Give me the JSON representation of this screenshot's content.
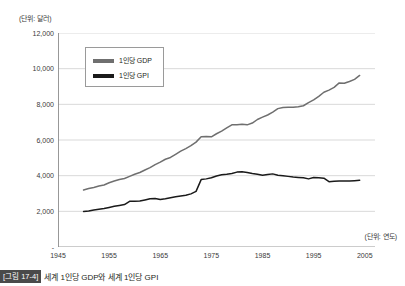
{
  "figure": {
    "unit_y_label": "(단위: 달러)",
    "unit_x_label": "(단위: 연도)",
    "caption_badge": "[그림 17-4]",
    "caption_text": "세계 1인당 GDP와 세계 1인당 GPI"
  },
  "legend": {
    "items": [
      {
        "label": "1인당 GDP",
        "color": "#6f6f6f"
      },
      {
        "label": "1인당 GPI",
        "color": "#1a1a1a"
      }
    ]
  },
  "chart_data": {
    "type": "line",
    "title": "세계 1인당 GDP와 세계 1인당 GPI",
    "xlabel": "(단위: 연도)",
    "ylabel": "(단위: 달러)",
    "xlim": [
      1945,
      2007
    ],
    "ylim": [
      0,
      12000
    ],
    "grid": true,
    "legend_position": "top-left-inside",
    "ytick_labels": [
      "12,000",
      "10,000",
      "8,000",
      "6,000",
      "4,000",
      "2,000",
      "-"
    ],
    "ytick_values": [
      12000,
      10000,
      8000,
      6000,
      4000,
      2000,
      0
    ],
    "xtick_labels": [
      "1945",
      "1955",
      "1965",
      "1975",
      "1985",
      "1995",
      "2005"
    ],
    "xtick_values": [
      1945,
      1955,
      1965,
      1975,
      1985,
      1995,
      2005
    ],
    "series": [
      {
        "name": "1인당 GDP",
        "color": "#6f6f6f",
        "x": [
          1950,
          1951,
          1952,
          1953,
          1954,
          1955,
          1956,
          1957,
          1958,
          1959,
          1960,
          1961,
          1962,
          1963,
          1964,
          1965,
          1966,
          1967,
          1968,
          1969,
          1970,
          1971,
          1972,
          1973,
          1974,
          1975,
          1976,
          1977,
          1978,
          1979,
          1980,
          1981,
          1982,
          1983,
          1984,
          1985,
          1986,
          1987,
          1988,
          1989,
          1990,
          1991,
          1992,
          1993,
          1994,
          1995,
          1996,
          1997,
          1998,
          1999,
          2000,
          2001,
          2002,
          2003,
          2004
        ],
        "values": [
          3200,
          3280,
          3340,
          3420,
          3480,
          3600,
          3700,
          3780,
          3840,
          3960,
          4080,
          4180,
          4320,
          4450,
          4620,
          4760,
          4920,
          5020,
          5200,
          5380,
          5520,
          5680,
          5880,
          6180,
          6200,
          6180,
          6350,
          6500,
          6680,
          6850,
          6860,
          6880,
          6850,
          6950,
          7150,
          7280,
          7400,
          7560,
          7760,
          7820,
          7840,
          7830,
          7860,
          7920,
          8100,
          8250,
          8450,
          8680,
          8800,
          8950,
          9200,
          9180,
          9280,
          9400,
          9620
        ],
        "end_value_note": "ends near 9,600 in 2004"
      },
      {
        "name": "1인당 GPI",
        "color": "#1a1a1a",
        "x": [
          1950,
          1951,
          1952,
          1953,
          1954,
          1955,
          1956,
          1957,
          1958,
          1959,
          1960,
          1961,
          1962,
          1963,
          1964,
          1965,
          1966,
          1967,
          1968,
          1969,
          1970,
          1971,
          1972,
          1973,
          1974,
          1975,
          1976,
          1977,
          1978,
          1979,
          1980,
          1981,
          1982,
          1983,
          1984,
          1985,
          1986,
          1987,
          1988,
          1989,
          1990,
          1991,
          1992,
          1993,
          1994,
          1995,
          1996,
          1997,
          1998,
          1999,
          2000,
          2001,
          2002,
          2003,
          2004
        ],
        "values": [
          1990,
          2020,
          2080,
          2120,
          2160,
          2220,
          2280,
          2330,
          2380,
          2560,
          2570,
          2580,
          2640,
          2700,
          2720,
          2660,
          2700,
          2760,
          2820,
          2860,
          2900,
          2980,
          3120,
          3780,
          3820,
          3880,
          3980,
          4050,
          4080,
          4120,
          4200,
          4220,
          4180,
          4120,
          4080,
          4020,
          4060,
          4100,
          4020,
          4000,
          3960,
          3920,
          3900,
          3880,
          3820,
          3900,
          3880,
          3860,
          3660,
          3680,
          3700,
          3700,
          3700,
          3720,
          3740
        ],
        "end_value_note": "ends near 3,750 in 2004"
      }
    ]
  }
}
